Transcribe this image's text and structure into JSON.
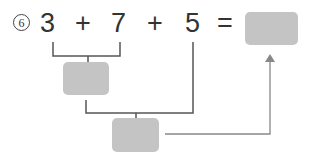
{
  "problem": {
    "number": "6",
    "tokens": [
      "3",
      "+",
      "7",
      "+",
      "5",
      "="
    ],
    "answer_box": "",
    "step1_box": "",
    "step2_box": ""
  },
  "colors": {
    "text": "#333333",
    "box_fill": "#c4c4c4",
    "bracket_line": "#555555",
    "arrow_line": "#888888"
  }
}
